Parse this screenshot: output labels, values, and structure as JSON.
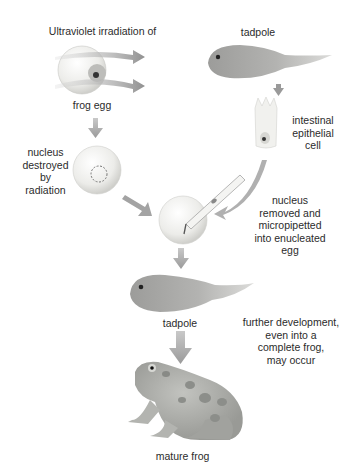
{
  "diagram": {
    "type": "nuclear-transplantation",
    "labels": {
      "uv_irradiation": "Ultraviolet irradiation of",
      "frog_egg": "frog egg",
      "tadpole_donor": "tadpole",
      "intestinal_cell": "intestinal\nepithelial\ncell",
      "nucleus_destroyed": "nucleus\ndestroyed\nby\nradiation",
      "nucleus_transfer": "nucleus\nremoved and\nmicropipetted\ninto enucleated\negg",
      "tadpole_result": "tadpole",
      "further_development": "further development,\neven into a\ncomplete frog,\nmay occur",
      "mature_frog": "mature frog"
    },
    "colors": {
      "arrow": "#9a9a9a",
      "egg": "#ececea",
      "tadpole": "#a8a8a6",
      "frog": "#a9aaa6",
      "frog_spots": "#8a8c88",
      "text": "#2b2b2b"
    }
  }
}
